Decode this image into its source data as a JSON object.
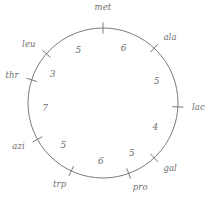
{
  "figure": {
    "name": "circular-genetic-map",
    "stroke_color": "#7a7a7a",
    "text_color": "#6f6f6f",
    "background": "#ffffff"
  },
  "chart_data": {
    "type": "diagram",
    "subtype": "circular-linkage-map",
    "title": "",
    "center": [
      103,
      103
    ],
    "radius": 75,
    "grid": false,
    "legend": null,
    "markers": [
      {
        "label": "met",
        "angle_deg": 0,
        "label_pos": "top"
      },
      {
        "label": "ala",
        "angle_deg": 43,
        "label_pos": "outer-right"
      },
      {
        "label": "lac",
        "angle_deg": 93,
        "label_pos": "right"
      },
      {
        "label": "gal",
        "angle_deg": 137,
        "label_pos": "outer-right"
      },
      {
        "label": "pro",
        "angle_deg": 160,
        "label_pos": "bottom"
      },
      {
        "label": "trp",
        "angle_deg": 205,
        "label_pos": "bottom"
      },
      {
        "label": "azi",
        "angle_deg": 241,
        "label_pos": "outer-left"
      },
      {
        "label": "thr",
        "angle_deg": 288,
        "label_pos": "left"
      },
      {
        "label": "leu",
        "angle_deg": 311,
        "label_pos": "outer-left"
      }
    ],
    "intervals": [
      {
        "from": "met",
        "to": "ala",
        "value": 6,
        "mid_angle_deg": 21
      },
      {
        "from": "ala",
        "to": "lac",
        "value": 5,
        "mid_angle_deg": 68
      },
      {
        "from": "lac",
        "to": "gal",
        "value": 4,
        "mid_angle_deg": 115
      },
      {
        "from": "gal",
        "to": "pro",
        "value": 5,
        "mid_angle_deg": 150
      },
      {
        "from": "pro",
        "to": "trp",
        "value": 6,
        "mid_angle_deg": 182
      },
      {
        "from": "trp",
        "to": "azi",
        "value": 5,
        "mid_angle_deg": 223
      },
      {
        "from": "azi",
        "to": "thr",
        "value": 7,
        "mid_angle_deg": 265
      },
      {
        "from": "thr",
        "to": "leu",
        "value": 3,
        "mid_angle_deg": 300
      },
      {
        "from": "leu",
        "to": "met",
        "value": 5,
        "mid_angle_deg": 335
      }
    ]
  }
}
